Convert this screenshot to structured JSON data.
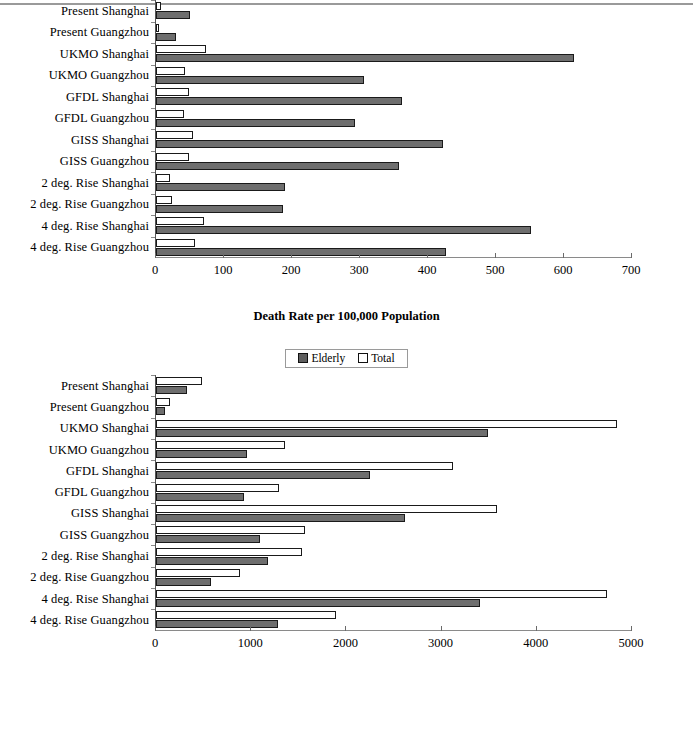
{
  "legend": {
    "elderly_label": "Elderly",
    "total_label": "Total",
    "elderly_color": "#6e6e6e",
    "total_color": "#ffffff"
  },
  "categories": [
    "Present Shanghai",
    "Present Guangzhou",
    "UKMO Shanghai",
    "UKMO Guangzhou",
    "GFDL Shanghai",
    "GFDL Guangzhou",
    "GISS Shanghai",
    "GISS Guangzhou",
    "2 deg. Rise Shanghai",
    "2 deg. Rise Guangzhou",
    "4 deg. Rise Shanghai",
    "4 deg. Rise Guangzhou"
  ],
  "chart_data": [
    {
      "type": "bar",
      "orientation": "horizontal",
      "title": "",
      "xlabel": "Death Rate per 100,000 Population",
      "ylabel": "",
      "xlim": [
        0,
        700
      ],
      "xticks": [
        0,
        100,
        200,
        300,
        400,
        500,
        600,
        700
      ],
      "xticklabels": [
        "0",
        "100",
        "200",
        "300",
        "400",
        "500",
        "600",
        "700"
      ],
      "grid": false,
      "legend_position": "bottom-center",
      "categories": [
        "Present Shanghai",
        "Present Guangzhou",
        "UKMO Shanghai",
        "UKMO Guangzhou",
        "GFDL Shanghai",
        "GFDL Guangzhou",
        "GISS Shanghai",
        "GISS Guangzhou",
        "2 deg. Rise Shanghai",
        "2 deg. Rise Guangzhou",
        "4 deg. Rise Shanghai",
        "4 deg. Rise Guangzhou"
      ],
      "series": [
        {
          "name": "Total",
          "values": [
            7,
            5,
            73,
            43,
            48,
            41,
            54,
            49,
            21,
            24,
            70,
            57
          ]
        },
        {
          "name": "Elderly",
          "values": [
            50,
            30,
            615,
            306,
            362,
            293,
            422,
            357,
            190,
            187,
            551,
            426
          ]
        }
      ]
    },
    {
      "type": "bar",
      "orientation": "horizontal",
      "title": "",
      "xlabel": "Raw Mortality Total",
      "ylabel": "",
      "xlim": [
        0,
        5000
      ],
      "xticks": [
        0,
        1000,
        2000,
        3000,
        4000,
        5000
      ],
      "xticklabels": [
        "0",
        "1000",
        "2000",
        "3000",
        "4000",
        "5000"
      ],
      "grid": false,
      "legend_position": "bottom-center",
      "categories": [
        "Present Shanghai",
        "Present Guangzhou",
        "UKMO Shanghai",
        "UKMO Guangzhou",
        "GFDL Shanghai",
        "GFDL Guangzhou",
        "GISS Shanghai",
        "GISS Guangzhou",
        "2 deg. Rise Shanghai",
        "2 deg. Rise Guangzhou",
        "4 deg. Rise Shanghai",
        "4 deg. Rise Guangzhou"
      ],
      "series": [
        {
          "name": "Total",
          "values": [
            480,
            150,
            4840,
            1350,
            3120,
            1290,
            3580,
            1560,
            1530,
            880,
            4740,
            1890
          ]
        },
        {
          "name": "Elderly",
          "values": [
            330,
            90,
            3490,
            960,
            2250,
            920,
            2620,
            1090,
            1180,
            580,
            3400,
            1280
          ]
        }
      ]
    }
  ]
}
